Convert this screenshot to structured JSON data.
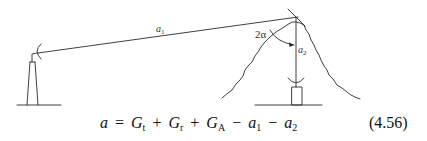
{
  "diagram": {
    "labels": {
      "path1": {
        "base": "a",
        "sub": "1"
      },
      "path2": {
        "base": "a",
        "sub": "2"
      },
      "angle": "2α"
    },
    "elements": [
      "transmitter-tower",
      "receiver-tower",
      "mountain",
      "reflector-plane",
      "path-a1",
      "path-a2",
      "angle-arc"
    ]
  },
  "equation": {
    "lhs": "a",
    "equals": "=",
    "terms": [
      {
        "base": "G",
        "sub": "t",
        "op": ""
      },
      {
        "base": "G",
        "sub": "r",
        "op": "+"
      },
      {
        "base": "G",
        "sub": "A",
        "op": "+"
      },
      {
        "base": "a",
        "sub": "1",
        "op": "−"
      },
      {
        "base": "a",
        "sub": "2",
        "op": "−"
      }
    ],
    "number": "(4.56)"
  }
}
